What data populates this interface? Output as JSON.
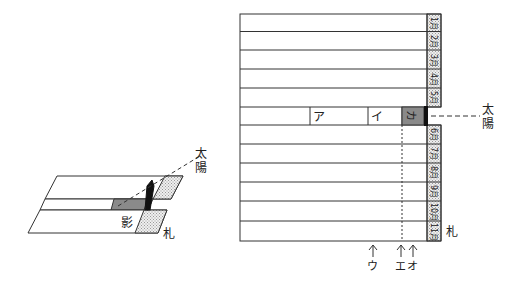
{
  "left_figure": {
    "sun_label": [
      "太",
      "陽"
    ],
    "shadow_label": "影",
    "card_label": "札"
  },
  "right_figure": {
    "months": [
      "1月",
      "2月",
      "3月",
      "4月",
      "5月",
      "6月",
      "7月",
      "8月",
      "9月",
      "10月",
      "11月",
      "12月"
    ],
    "middle_row_labels": {
      "a": "ア",
      "i": "イ",
      "ka": "カ"
    },
    "sun_label": [
      "太",
      "陽"
    ],
    "card_label": "札",
    "arrows": [
      {
        "label": "ウ"
      },
      {
        "label": "エ"
      },
      {
        "label": "オ"
      }
    ]
  },
  "colors": {
    "line": "#333333",
    "shade_dark": "#8a8a8a",
    "dot_fill": "#d9d9d9",
    "bar": "#111111"
  }
}
